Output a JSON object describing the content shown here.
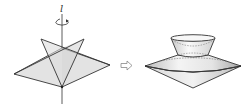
{
  "figure": {
    "axis_label": "l",
    "arrow_icon": "hollow-right-arrow",
    "colors": {
      "stroke": "#333333",
      "fill_light": "#e6e6e6",
      "fill_mid": "#d9d9d9",
      "background": "#ffffff"
    },
    "left_shape": "planar figure with rotation axis l",
    "right_shape": "solid of revolution (frustum on double cone)"
  }
}
